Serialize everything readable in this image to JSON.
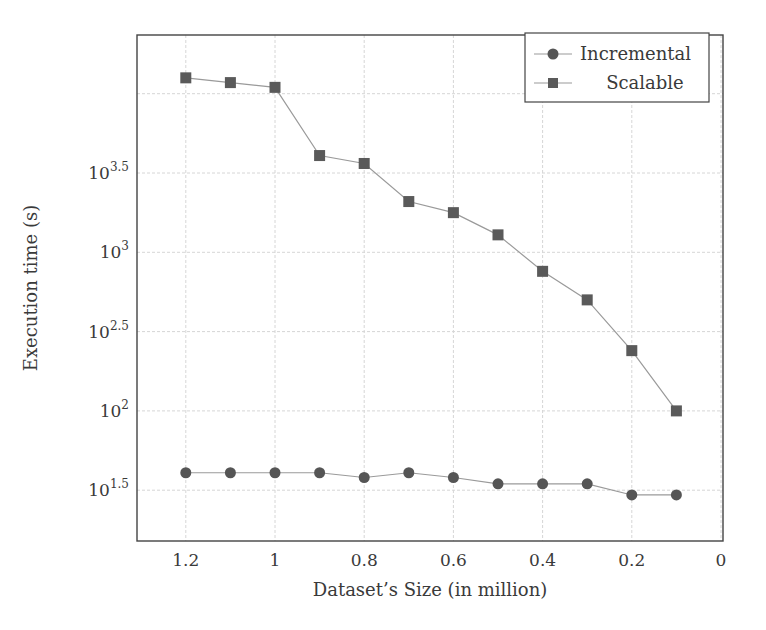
{
  "chart_data": {
    "type": "line",
    "title": "",
    "xlabel": "Dataset’s Size (in million)",
    "ylabel": "Execution time (s)",
    "x_reversed": true,
    "xlim": [
      1.3,
      0
    ],
    "x_ticks": [
      1.2,
      1,
      0.8,
      0.6,
      0.4,
      0.2,
      0
    ],
    "x_tick_labels": [
      "1.2",
      "1",
      "0.8",
      "0.6",
      "0.4",
      "0.2",
      "0"
    ],
    "y_scale": "log10",
    "ylim_log10": [
      1.18,
      4.38
    ],
    "y_ticks_log10": [
      1.5,
      2,
      2.5,
      3,
      3.5
    ],
    "y_tick_labels": [
      {
        "base": "10",
        "exp": "1.5"
      },
      {
        "base": "10",
        "exp": "2"
      },
      {
        "base": "10",
        "exp": "2.5"
      },
      {
        "base": "10",
        "exp": "3"
      },
      {
        "base": "10",
        "exp": "3.5"
      }
    ],
    "grid": true,
    "legend_position": "top-right",
    "x": [
      1.2,
      1.1,
      1.0,
      0.9,
      0.8,
      0.7,
      0.6,
      0.5,
      0.4,
      0.3,
      0.2,
      0.1
    ],
    "series": [
      {
        "name": "Incremental",
        "marker": "circle",
        "color": "#555555",
        "values_log10": [
          1.61,
          1.61,
          1.61,
          1.61,
          1.58,
          1.61,
          1.58,
          1.54,
          1.54,
          1.54,
          1.47,
          1.47
        ],
        "values": [
          41,
          41,
          41,
          41,
          38,
          41,
          38,
          35,
          35,
          35,
          30,
          30
        ]
      },
      {
        "name": "Scalable",
        "marker": "square",
        "color": "#5a5a5a",
        "values_log10": [
          4.1,
          4.07,
          4.04,
          3.61,
          3.56,
          3.32,
          3.25,
          3.11,
          2.88,
          2.7,
          2.38,
          2.0
        ],
        "values": [
          12600,
          11700,
          11000,
          4070,
          3630,
          2090,
          1780,
          1290,
          760,
          500,
          240,
          100
        ]
      }
    ]
  },
  "legend": {
    "items": [
      {
        "label": "Incremental",
        "marker": "circle"
      },
      {
        "label": "Scalable",
        "marker": "square"
      }
    ]
  }
}
